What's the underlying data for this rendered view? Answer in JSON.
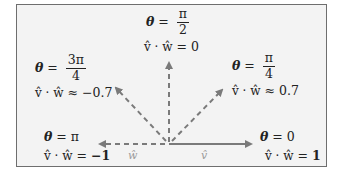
{
  "diagram": {
    "title": "",
    "colors": {
      "frame_bg": "#f3f3f3",
      "frame_border": "#6e6e6e",
      "arrow": "#7a7a7a",
      "text": "#222222",
      "vector_label": "#9a9a9a"
    },
    "origin": {
      "x": 169,
      "y": 144
    },
    "vectors": [
      {
        "id": "v_hat",
        "label": "v̂",
        "style": "solid",
        "angle": "0",
        "tip": {
          "x": 253,
          "y": 144
        }
      },
      {
        "id": "w_hat",
        "label": "ŵ",
        "style": "dashed",
        "angle": "π",
        "tip": {
          "x": 97,
          "y": 144
        }
      }
    ],
    "dashed_directions": [
      {
        "angle": "π/2",
        "tip": {
          "x": 169,
          "y": 60
        }
      },
      {
        "angle": "π/4",
        "tip": {
          "x": 224,
          "y": 88
        }
      },
      {
        "angle": "3π/4",
        "tip": {
          "x": 114,
          "y": 86
        }
      }
    ],
    "annotations": [
      {
        "id": "theta-pi-over-2",
        "theta_lhs": "θ",
        "eq": "=",
        "num": "π",
        "den": "2",
        "dot_expr": "v̂ · ŵ",
        "rel": "=",
        "value": "0"
      },
      {
        "id": "theta-3pi-over-4",
        "theta_lhs": "θ",
        "eq": "=",
        "num": "3π",
        "den": "4",
        "dot_expr": "v̂ · ŵ",
        "rel": "≈",
        "value": "−0.7"
      },
      {
        "id": "theta-pi-over-4",
        "theta_lhs": "θ",
        "eq": "=",
        "num": "π",
        "den": "4",
        "dot_expr": "v̂ · ŵ",
        "rel": "≈",
        "value": "0.7"
      },
      {
        "id": "theta-pi",
        "theta_lhs": "θ",
        "eq": "=",
        "rhs": "π",
        "dot_expr": "v̂ · ŵ",
        "rel": "=",
        "value": "−1"
      },
      {
        "id": "theta-0",
        "theta_lhs": "θ",
        "eq": "=",
        "rhs": "0",
        "dot_expr": "v̂ · ŵ",
        "rel": "=",
        "value": "1"
      }
    ]
  }
}
